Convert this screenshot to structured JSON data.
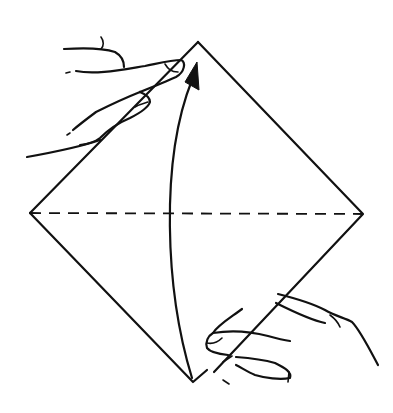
{
  "diagram": {
    "type": "origami-fold-instruction",
    "description": "Square paper turned as a diamond; fold bottom corner up to top corner along the horizontal dashed valley-fold line",
    "paper": {
      "shape": "diamond",
      "vertices": {
        "top": [
          198,
          42
        ],
        "left": [
          30,
          213
        ],
        "right": [
          363,
          214
        ],
        "bottom": [
          195,
          383
        ]
      }
    },
    "fold_line": {
      "style": "dashed",
      "from": [
        30,
        213
      ],
      "to": [
        363,
        214
      ]
    },
    "arrow": {
      "direction": "up",
      "from": [
        192,
        378
      ],
      "to": [
        194,
        62
      ]
    },
    "hands": [
      {
        "position": "upper-left",
        "holding": "top corner"
      },
      {
        "position": "lower-right",
        "holding": "bottom corner"
      }
    ],
    "colors": {
      "ink": "#111111",
      "background": "#ffffff"
    }
  }
}
